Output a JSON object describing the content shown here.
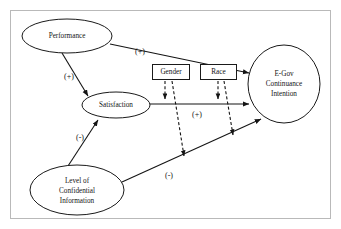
{
  "figure": {
    "frame": {
      "visible": true,
      "color": "#b9b9b9"
    },
    "background_color": "#ffffff",
    "line_color": "#141414"
  },
  "nodes": [
    {
      "id": "performance",
      "type": "ellipse",
      "label": "Performance",
      "lines": [
        "Performance"
      ],
      "cx": 67,
      "cy": 36,
      "rx": 45,
      "ry": 17
    },
    {
      "id": "satisfaction",
      "type": "ellipse",
      "label": "Satisfaction",
      "lines": [
        "Satisfaction"
      ],
      "cx": 116,
      "cy": 105,
      "rx": 34,
      "ry": 13
    },
    {
      "id": "confidential",
      "type": "ellipse",
      "label": "Level of Confidential Information",
      "lines": [
        "Level of",
        "Confidential",
        "Information"
      ],
      "cx": 77,
      "cy": 190,
      "rx": 47,
      "ry": 25
    },
    {
      "id": "egov",
      "type": "ellipse",
      "label": "E-Gov Continuance Intention",
      "lines": [
        "E-Gov",
        "Continuance",
        "Intention"
      ],
      "cx": 284,
      "cy": 84,
      "rx": 36,
      "ry": 39
    },
    {
      "id": "gender",
      "type": "rect",
      "label": "Gender",
      "lines": [
        "Gender"
      ],
      "x": 152,
      "y": 64,
      "w": 38,
      "h": 16
    },
    {
      "id": "race",
      "type": "rect",
      "label": "Race",
      "lines": [
        "Race"
      ],
      "x": 200,
      "y": 64,
      "w": 37,
      "h": 16
    }
  ],
  "edges": [
    {
      "id": "performance-to-egov",
      "from": "performance",
      "to": "egov",
      "style": "solid",
      "sign": "(+)",
      "sign_x": 140,
      "sign_y": 52
    },
    {
      "id": "performance-to-satisfaction",
      "from": "performance",
      "to": "satisfaction",
      "style": "solid",
      "sign": "(+)",
      "sign_x": 69,
      "sign_y": 77
    },
    {
      "id": "satisfaction-to-egov",
      "from": "satisfaction",
      "to": "egov",
      "style": "solid",
      "sign": "(+)",
      "sign_x": 197,
      "sign_y": 115
    },
    {
      "id": "confidential-to-satisfaction",
      "from": "confidential",
      "to": "satisfaction",
      "style": "solid",
      "sign": "(-)",
      "sign_x": 80,
      "sign_y": 138
    },
    {
      "id": "confidential-to-egov",
      "from": "confidential",
      "to": "egov",
      "style": "solid",
      "sign": "(-)",
      "sign_x": 169,
      "sign_y": 176
    },
    {
      "id": "gender-moderates-satisfaction-egov",
      "from": "gender",
      "to": "satisfaction-to-egov",
      "style": "dashed",
      "sign": ""
    },
    {
      "id": "gender-moderates-confidential-egov",
      "from": "gender",
      "to": "confidential-to-egov",
      "style": "dashed",
      "sign": ""
    },
    {
      "id": "race-moderates-satisfaction-egov",
      "from": "race",
      "to": "satisfaction-to-egov",
      "style": "dashed",
      "sign": ""
    },
    {
      "id": "race-moderates-confidential-egov",
      "from": "race",
      "to": "confidential-to-egov",
      "style": "dashed",
      "sign": ""
    }
  ],
  "signs": {
    "plus": "(+)",
    "minus": "(-)"
  },
  "labels": {
    "performance": "Performance",
    "satisfaction": "Satisfaction",
    "confidential_l1": "Level of",
    "confidential_l2": "Confidential",
    "confidential_l3": "Information",
    "egov_l1": "E-Gov",
    "egov_l2": "Continuance",
    "egov_l3": "Intention",
    "gender": "Gender",
    "race": "Race",
    "sign_perf_egov": "(+)",
    "sign_perf_sat": "(+)",
    "sign_sat_egov": "(+)",
    "sign_conf_sat": "(-)",
    "sign_conf_egov": "(-)"
  }
}
